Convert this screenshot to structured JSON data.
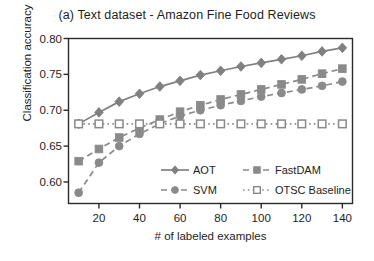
{
  "chart_data": {
    "type": "line",
    "title": "(a) Text dataset - Amazon Fine Food Reviews",
    "xlabel": "# of labeled examples",
    "ylabel": "Classification accuracy",
    "xlim": [
      5,
      145
    ],
    "ylim": [
      0.57,
      0.8
    ],
    "xticks": [
      20,
      40,
      60,
      80,
      100,
      120,
      140
    ],
    "xtick_labels": [
      "20",
      "40",
      "60",
      "80",
      "100",
      "120",
      "140"
    ],
    "yticks": [
      0.6,
      0.65,
      0.7,
      0.75,
      0.8
    ],
    "ytick_labels": [
      "0.60",
      "0.65",
      "0.70",
      "0.75",
      "0.80"
    ],
    "grid": false,
    "legend_position": "lower-right-inside",
    "x": [
      10,
      20,
      30,
      40,
      50,
      60,
      70,
      80,
      90,
      100,
      110,
      120,
      130,
      140
    ],
    "series": [
      {
        "name": "AOT",
        "color": "#808080",
        "linestyle": "solid",
        "marker": "diamond",
        "marker_fill": "filled",
        "values": [
          0.681,
          0.697,
          0.712,
          0.723,
          0.733,
          0.741,
          0.749,
          0.755,
          0.761,
          0.766,
          0.771,
          0.776,
          0.782,
          0.787
        ],
        "errorbars": [
          0.006,
          0.006,
          0.005,
          0.004,
          0.003,
          0.003,
          0.002,
          0.002,
          0.002,
          0.002,
          0.002,
          0.002,
          0.002,
          0.002
        ]
      },
      {
        "name": "FastDAM",
        "color": "#8a8a8a",
        "linestyle": "dashed",
        "marker": "square",
        "marker_fill": "filled",
        "values": [
          0.629,
          0.646,
          0.662,
          0.675,
          0.687,
          0.698,
          0.707,
          0.715,
          0.722,
          0.729,
          0.736,
          0.743,
          0.751,
          0.758
        ]
      },
      {
        "name": "SVM",
        "color": "#8a8a8a",
        "linestyle": "dashed",
        "marker": "circle",
        "marker_fill": "filled",
        "values": [
          0.585,
          0.627,
          0.65,
          0.667,
          0.681,
          0.692,
          0.7,
          0.707,
          0.713,
          0.719,
          0.724,
          0.729,
          0.734,
          0.74
        ]
      },
      {
        "name": "OTSC Baseline",
        "color": "#8a8a8a",
        "linestyle": "dotted",
        "marker": "square",
        "marker_fill": "open",
        "values": [
          0.681,
          0.681,
          0.681,
          0.681,
          0.681,
          0.681,
          0.681,
          0.681,
          0.681,
          0.681,
          0.681,
          0.681,
          0.681,
          0.681
        ]
      }
    ],
    "legend": [
      {
        "label": "AOT",
        "column": 0,
        "row": 0
      },
      {
        "label": "SVM",
        "column": 0,
        "row": 1
      },
      {
        "label": "FastDAM",
        "column": 1,
        "row": 0
      },
      {
        "label": "OTSC Baseline",
        "column": 1,
        "row": 1
      }
    ]
  }
}
